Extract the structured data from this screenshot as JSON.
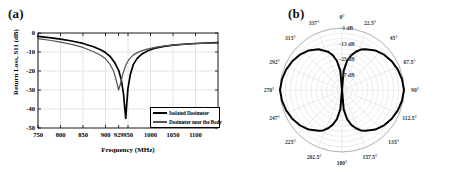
{
  "figure": {
    "panel_a_label": "(a)",
    "panel_b_label": "(b)"
  },
  "chart_data": [
    {
      "type": "line",
      "panel": "(a)",
      "title": "",
      "xlabel": "Frequency (MHz)",
      "ylabel": "Return Loss, S11 (dB)",
      "xlim": [
        750,
        1150
      ],
      "ylim": [
        -50,
        0
      ],
      "grid": true,
      "xticks": [
        750,
        800,
        850,
        900,
        929,
        950,
        1000,
        1050,
        1100
      ],
      "xtick_labels": [
        "750",
        "800",
        "850",
        "900",
        "929",
        "950",
        "1000",
        "1050",
        "1100"
      ],
      "yticks": [
        0,
        -10,
        -20,
        -30,
        -40,
        -50
      ],
      "ytick_labels": [
        "0",
        "-10",
        "-20",
        "-30",
        "-40",
        "-50"
      ],
      "legend_position": "lower right",
      "series": [
        {
          "name": "Isolated Dosimeter",
          "color": "#000000",
          "resonance_mhz": 945,
          "resonance_db": -45,
          "x": [
            750,
            775,
            800,
            825,
            850,
            875,
            890,
            900,
            910,
            920,
            929,
            935,
            940,
            943,
            945,
            947,
            950,
            955,
            962,
            970,
            980,
            995,
            1010,
            1030,
            1050,
            1080,
            1110,
            1150
          ],
          "y": [
            -1.8,
            -2.4,
            -3.2,
            -4.2,
            -5.5,
            -7.4,
            -8.9,
            -10.3,
            -12.3,
            -15.4,
            -19.5,
            -24.5,
            -32.0,
            -40.0,
            -45.0,
            -38.0,
            -29.0,
            -22.0,
            -16.5,
            -13.5,
            -11.2,
            -9.2,
            -8.0,
            -7.0,
            -6.4,
            -5.8,
            -5.4,
            -5.1
          ]
        },
        {
          "name": "Dosimeter near the Body",
          "color": "#555555",
          "resonance_mhz": 929,
          "resonance_db": -30,
          "x": [
            750,
            775,
            800,
            825,
            850,
            875,
            890,
            900,
            910,
            918,
            924,
            929,
            933,
            938,
            945,
            952,
            962,
            975,
            990,
            1010,
            1030,
            1050,
            1080,
            1110,
            1150
          ],
          "y": [
            -3.0,
            -3.8,
            -4.8,
            -6.0,
            -7.6,
            -10.0,
            -11.8,
            -13.6,
            -16.5,
            -20.0,
            -25.0,
            -30.0,
            -27.0,
            -22.0,
            -17.0,
            -14.0,
            -11.5,
            -9.8,
            -8.6,
            -7.6,
            -6.9,
            -6.4,
            -5.9,
            -5.5,
            -5.2
          ]
        }
      ]
    },
    {
      "type": "line",
      "panel": "(b)",
      "projection": "polar",
      "title": "",
      "grid": true,
      "angle_unit": "degrees",
      "angle_tick_labels": [
        "0°",
        "22.5°",
        "45°",
        "67.5°",
        "90°",
        "112.5°",
        "135°",
        "157.5°",
        "180°",
        "202.5°",
        "225°",
        "247°",
        "270°",
        "292°",
        "315°",
        "337°"
      ],
      "angle_ticks": [
        0,
        22.5,
        45,
        67.5,
        90,
        112.5,
        135,
        157.5,
        180,
        202.5,
        225,
        247.5,
        270,
        292.5,
        315,
        337.5
      ],
      "radial_tick_labels": [
        "-1 dB",
        "-13 dB",
        "-25 dB",
        "-37 dB"
      ],
      "radial_ticks": [
        -1,
        -13,
        -25,
        -37
      ],
      "rlim": [
        -49,
        -1
      ],
      "series": [
        {
          "name": "Radiation Pattern",
          "color": "#000000",
          "theta": [
            0,
            5,
            10,
            15,
            20,
            25,
            30,
            40,
            50,
            60,
            70,
            80,
            90,
            100,
            110,
            120,
            130,
            140,
            150,
            155,
            160,
            165,
            170,
            175,
            180,
            185,
            190,
            195,
            200,
            205,
            210,
            220,
            230,
            240,
            250,
            260,
            270,
            280,
            290,
            300,
            310,
            320,
            330,
            340,
            345,
            350,
            355,
            360
          ],
          "r_db": [
            -49,
            -34,
            -26,
            -21,
            -17.5,
            -14.5,
            -12.5,
            -9.0,
            -6.5,
            -4.5,
            -3.0,
            -1.8,
            -1.0,
            -1.8,
            -3.0,
            -4.5,
            -6.5,
            -9.0,
            -12.5,
            -14.5,
            -17.5,
            -21,
            -26,
            -34,
            -49,
            -34,
            -26,
            -21,
            -17.5,
            -14.5,
            -12.5,
            -9.0,
            -6.5,
            -4.5,
            -3.0,
            -1.8,
            -1.0,
            -1.8,
            -3.0,
            -4.5,
            -6.5,
            -9.0,
            -12.5,
            -17.5,
            -21,
            -26,
            -34,
            -49
          ]
        }
      ]
    }
  ]
}
